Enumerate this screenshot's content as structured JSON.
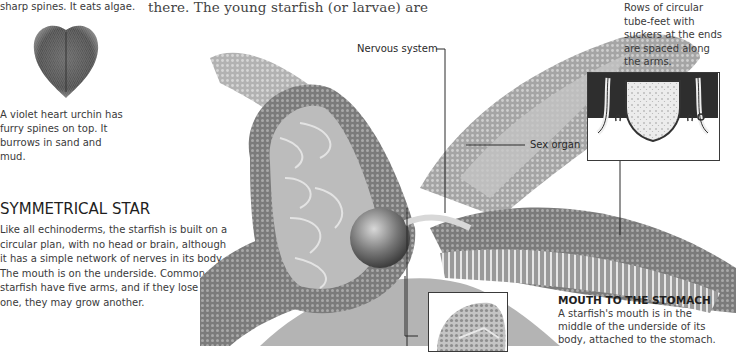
{
  "left_column": {
    "top_caption_fragment": "sharp spines. It eats algae.",
    "urchin_caption": "A violet heart urchin has furry spines on top. It burrows in sand and mud.",
    "urchin_caption_lines": [
      "A violet heart urchin has",
      "furry spines on top. It",
      "burrows in sand and mud."
    ],
    "section_heading": "SYMMETRICAL STAR",
    "section_body_lines": [
      "Like all echinoderms, the starfish is built on a",
      "circular plan, with no head or brain, although",
      "it has a simple network of nerves in its body.",
      "The mouth is on the underside. Common",
      "starfish have five arms, and if they lose",
      "one, they may grow another."
    ]
  },
  "main_text": {
    "top_line": "there. The young starfish (or larvae) are"
  },
  "labels": {
    "nervous_system": "Nervous system",
    "sex_organ": "Sex organ"
  },
  "tube_feet_caption": {
    "lines": [
      "Rows of circular",
      "tube-feet with",
      "suckers at the ends",
      "are spaced along",
      "the arms."
    ]
  },
  "mouth_section": {
    "heading": "MOUTH TO THE STOMACH",
    "body_lines": [
      "A starfish's mouth is in the",
      "middle of the underside of its",
      "body, attached to the stomach."
    ]
  },
  "illustrations": {
    "urchin": "violet-heart-urchin-illustration",
    "starfish": "starfish-cutaway-illustration",
    "tube_feet_inset": "tube-feet-cross-section-inset",
    "mouth_inset": "starfish-mouth-inset"
  },
  "colors": {
    "text": "#3a3a3a",
    "heading": "#1e1e1e",
    "leader_line": "#2a2a2a",
    "illustration_dark": "#5a5a5a",
    "illustration_mid": "#8c8c8c",
    "illustration_light": "#c8c8c8"
  }
}
